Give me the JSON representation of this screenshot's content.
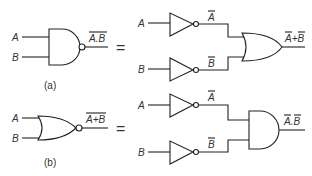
{
  "diagram": {
    "equals_sign": "=",
    "part_a": {
      "caption": "(a)",
      "left": {
        "gate": "NAND",
        "inputs": [
          "A",
          "B"
        ],
        "output": "A.B",
        "output_overbar": "full"
      },
      "right": {
        "inverters": [
          {
            "input": "A",
            "output": "A",
            "output_overbar": true
          },
          {
            "input": "B",
            "output": "B",
            "output_overbar": true
          }
        ],
        "gate": "OR",
        "output_parts": [
          "A",
          "+",
          "B"
        ],
        "output_overbar": "each-variable"
      }
    },
    "part_b": {
      "caption": "(b)",
      "left": {
        "gate": "NOR",
        "inputs": [
          "A",
          "B"
        ],
        "output": "A+B",
        "output_overbar": "full"
      },
      "right": {
        "inverters": [
          {
            "input": "A",
            "output": "A",
            "output_overbar": true
          },
          {
            "input": "B",
            "output": "B",
            "output_overbar": true
          }
        ],
        "gate": "AND",
        "output_parts": [
          "A",
          ".",
          "B"
        ],
        "output_overbar": "each-variable"
      }
    }
  }
}
